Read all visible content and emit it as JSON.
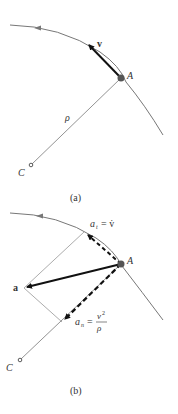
{
  "figure": {
    "panels": [
      {
        "id": "a",
        "caption": "(a)",
        "labels": {
          "point": "A",
          "center": "C",
          "velocity": "v",
          "radius": "ρ"
        }
      },
      {
        "id": "b",
        "caption": "(b)",
        "labels": {
          "point": "A",
          "center": "C",
          "acceleration": "a",
          "tangential": "a",
          "tangential_sub": "t",
          "tangential_eq": "= v̇",
          "normal": "a",
          "normal_sub": "n",
          "normal_eq": "=",
          "normal_num": "v",
          "normal_num_sup": "2",
          "normal_den": "ρ"
        }
      }
    ],
    "colors": {
      "path": "#777777",
      "vector": "#111111",
      "point": "#555555",
      "construction": "#888888"
    }
  }
}
